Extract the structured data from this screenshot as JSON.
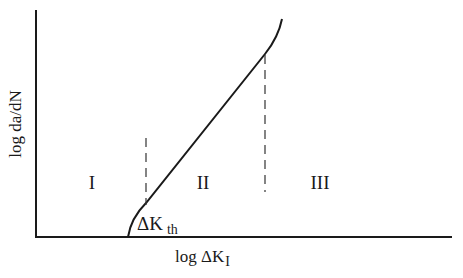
{
  "diagram": {
    "type": "fatigue-crack-growth-curve",
    "y_axis_label": "log da/dN",
    "x_axis_label_main": "log ΔK",
    "x_axis_label_sub": "I",
    "threshold_label_main": "ΔK",
    "threshold_label_sub": "th",
    "regions": [
      {
        "id": "region-1",
        "label": "I"
      },
      {
        "id": "region-2",
        "label": "II"
      },
      {
        "id": "region-3",
        "label": "III"
      }
    ],
    "colors": {
      "line": "#1a1a1a",
      "background": "#ffffff"
    }
  }
}
